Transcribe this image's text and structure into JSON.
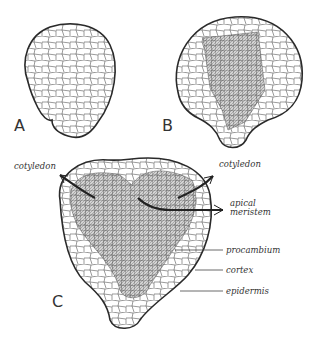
{
  "diagram": {
    "panels": [
      {
        "id": "A",
        "label": "A"
      },
      {
        "id": "B",
        "label": "B"
      },
      {
        "id": "C",
        "label": "C"
      }
    ],
    "labels": {
      "cotyledon_left": "cotyledon",
      "cotyledon_right": "cotyledon",
      "apical_meristem_1": "apical",
      "apical_meristem_2": "meristem",
      "procambium": "procambium",
      "cortex": "cortex",
      "epidermis": "epidermis"
    },
    "colors": {
      "outline": "#2a2a2a",
      "cell_wall": "#555555",
      "procambium_fill": "#bdbdbd",
      "background": "#ffffff"
    }
  }
}
